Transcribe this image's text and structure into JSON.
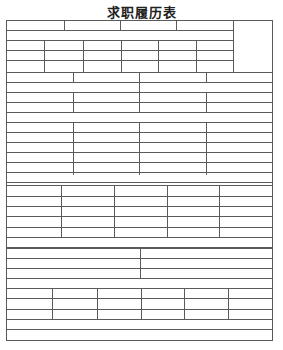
{
  "document": {
    "title": "求职履历表",
    "line_color": "#5a5a5a",
    "table": {
      "left": 6,
      "right": 272,
      "top": 20,
      "bottom": 340,
      "photo_column": {
        "left": 233,
        "top": 20,
        "bottom": 72
      },
      "sections": [
        {
          "name": "header-block",
          "rows": [
            20,
            30,
            40,
            50,
            60,
            72
          ],
          "segments": [
            {
              "y0": 20,
              "y1": 30,
              "x": [
                6,
                64,
                120,
                176,
                233
              ]
            },
            {
              "y0": 30,
              "y1": 40,
              "x": [
                6,
                233
              ]
            },
            {
              "y0": 40,
              "y1": 72,
              "x": [
                6,
                44,
                83,
                121,
                158,
                196,
                233
              ]
            }
          ]
        },
        {
          "name": "personal-info-block",
          "rows": [
            72,
            82,
            92,
            102,
            112,
            122
          ],
          "segments": [
            {
              "y0": 72,
              "y1": 82,
              "x": [
                6,
                73,
                139,
                206,
                272
              ]
            },
            {
              "y0": 82,
              "y1": 92,
              "x": [
                6,
                139,
                272
              ]
            },
            {
              "y0": 92,
              "y1": 112,
              "x": [
                6,
                73,
                139,
                206,
                272
              ]
            },
            {
              "y0": 112,
              "y1": 122,
              "x": [
                6,
                272
              ]
            }
          ]
        },
        {
          "name": "education-block",
          "rows": [
            122,
            132,
            142,
            152,
            162,
            172,
            182
          ],
          "segments": [
            {
              "y0": 122,
              "y1": 175,
              "x": [
                6,
                73,
                139,
                206,
                272
              ]
            },
            {
              "y0": 175,
              "y1": 185,
              "x": [
                6,
                272
              ]
            }
          ]
        },
        {
          "name": "experience-block",
          "rows": [
            185,
            196,
            206,
            216,
            227,
            237,
            247
          ],
          "segments": [
            {
              "y0": 185,
              "y1": 238,
              "x": [
                6,
                61,
                114,
                167,
                219,
                272
              ]
            },
            {
              "y0": 238,
              "y1": 248,
              "x": [
                6,
                272
              ]
            }
          ]
        },
        {
          "name": "skills-block",
          "rows": [
            248,
            258,
            268,
            278,
            288
          ],
          "segments": [
            {
              "y0": 248,
              "y1": 278,
              "x": [
                6,
                140,
                272
              ]
            },
            {
              "y0": 278,
              "y1": 288,
              "x": [
                6,
                272
              ]
            }
          ]
        },
        {
          "name": "family-block",
          "rows": [
            288,
            298,
            309,
            319,
            329,
            340
          ],
          "segments": [
            {
              "y0": 288,
              "y1": 319,
              "x": [
                6,
                52,
                97,
                141,
                184,
                228,
                272
              ]
            },
            {
              "y0": 319,
              "y1": 340,
              "x": [
                6,
                272
              ]
            }
          ]
        }
      ]
    }
  }
}
